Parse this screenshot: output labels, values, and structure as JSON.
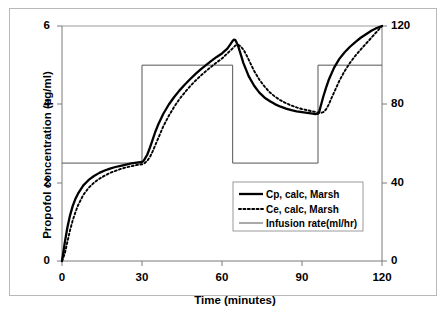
{
  "chart_data": {
    "type": "line",
    "title": "",
    "xlabel": "Time (minutes)",
    "ylabel": "Propofol concentration (µg/ml)",
    "y2label": "Infusion rate (ml/hr)",
    "xlim": [
      0,
      120
    ],
    "ylim": [
      0,
      6
    ],
    "y2lim": [
      0,
      120
    ],
    "xticks": [
      0,
      30,
      60,
      90,
      120
    ],
    "yticks": [
      0,
      2,
      4,
      6
    ],
    "y2ticks": [
      0,
      40,
      80,
      120
    ],
    "grid": false,
    "legend_position": "center-right-lower",
    "series": [
      {
        "name": "Cp, calc, Marsh",
        "style": "solid-thick",
        "axis": "left",
        "units": "µg/ml",
        "x": [
          0,
          0.5,
          1,
          2,
          3,
          4,
          5,
          6,
          8,
          10,
          12,
          14,
          16,
          18,
          20,
          22,
          24,
          26,
          28,
          30,
          30.5,
          31,
          32,
          33,
          34,
          35,
          36,
          38,
          40,
          42,
          44,
          46,
          48,
          50,
          52,
          54,
          56,
          58,
          60,
          62,
          63,
          64,
          64.5,
          65,
          66,
          67,
          68,
          70,
          72,
          74,
          76,
          78,
          80,
          82,
          84,
          86,
          88,
          90,
          92,
          94,
          95,
          96,
          96.5,
          97,
          98,
          99,
          100,
          102,
          104,
          106,
          108,
          110,
          112,
          114,
          116,
          118,
          120
        ],
        "y": [
          0,
          0.22,
          0.45,
          0.85,
          1.16,
          1.4,
          1.58,
          1.72,
          1.93,
          2.07,
          2.17,
          2.25,
          2.31,
          2.36,
          2.4,
          2.43,
          2.46,
          2.49,
          2.51,
          2.53,
          2.55,
          2.6,
          2.72,
          2.9,
          3.1,
          3.3,
          3.47,
          3.76,
          3.99,
          4.18,
          4.35,
          4.5,
          4.64,
          4.77,
          4.89,
          5.0,
          5.11,
          5.21,
          5.3,
          5.42,
          5.52,
          5.62,
          5.65,
          5.64,
          5.5,
          5.28,
          5.06,
          4.72,
          4.48,
          4.3,
          4.17,
          4.08,
          4.0,
          3.94,
          3.89,
          3.85,
          3.82,
          3.8,
          3.78,
          3.76,
          3.75,
          3.76,
          3.82,
          3.95,
          4.2,
          4.42,
          4.62,
          4.93,
          5.16,
          5.33,
          5.47,
          5.59,
          5.7,
          5.79,
          5.88,
          5.95,
          6.0
        ]
      },
      {
        "name": "Ce, calc, Marsh",
        "style": "dotted",
        "axis": "left",
        "units": "µg/ml",
        "x": [
          0,
          1,
          2,
          3,
          4,
          5,
          6,
          8,
          10,
          12,
          14,
          16,
          18,
          20,
          22,
          24,
          26,
          28,
          30,
          31,
          32,
          33,
          34,
          35,
          36,
          38,
          40,
          42,
          44,
          46,
          48,
          50,
          52,
          54,
          56,
          58,
          60,
          62,
          64,
          65,
          66,
          67,
          68,
          69,
          70,
          72,
          74,
          76,
          78,
          80,
          82,
          84,
          86,
          88,
          90,
          92,
          94,
          96,
          97,
          98,
          99,
          100,
          101,
          102,
          104,
          106,
          108,
          110,
          112,
          114,
          116,
          118,
          120
        ],
        "y": [
          0,
          0.18,
          0.48,
          0.78,
          1.03,
          1.24,
          1.42,
          1.69,
          1.87,
          2.0,
          2.1,
          2.18,
          2.25,
          2.3,
          2.35,
          2.39,
          2.42,
          2.45,
          2.47,
          2.5,
          2.56,
          2.66,
          2.8,
          2.96,
          3.12,
          3.44,
          3.7,
          3.93,
          4.13,
          4.3,
          4.46,
          4.6,
          4.73,
          4.85,
          4.96,
          5.07,
          5.17,
          5.3,
          5.43,
          5.5,
          5.52,
          5.48,
          5.4,
          5.28,
          5.14,
          4.86,
          4.63,
          4.45,
          4.3,
          4.19,
          4.1,
          4.03,
          3.97,
          3.92,
          3.88,
          3.85,
          3.82,
          3.79,
          3.78,
          3.8,
          3.87,
          3.99,
          4.15,
          4.3,
          4.6,
          4.85,
          5.06,
          5.24,
          5.4,
          5.55,
          5.7,
          5.85,
          6.0
        ]
      },
      {
        "name": "Infusion rate(ml/hr)",
        "style": "solid-thin",
        "axis": "right",
        "units": "ml/hr",
        "x": [
          0,
          30,
          30,
          64,
          64,
          96,
          96,
          120
        ],
        "y": [
          50,
          50,
          100,
          100,
          50,
          50,
          100,
          100
        ]
      }
    ]
  },
  "legend": {
    "items": [
      {
        "label": "Cp, calc, Marsh",
        "style": "solid-thick"
      },
      {
        "label": "Ce, calc, Marsh",
        "style": "dotted"
      },
      {
        "label": "Infusion rate(ml/hr)",
        "style": "solid-thin"
      }
    ]
  },
  "axes": {
    "left_title": "Propofol concentration (µg/ml)",
    "right_title": "Infusion rate (ml/hr)",
    "x_title": "Time (minutes)",
    "left_ticks": [
      "0",
      "2",
      "4",
      "6"
    ],
    "right_ticks": [
      "0",
      "40",
      "80",
      "120"
    ],
    "x_ticks": [
      "0",
      "30",
      "60",
      "90",
      "120"
    ]
  },
  "colors": {
    "series_cp": "#000000",
    "series_ce": "#000000",
    "series_infusion": "#555555",
    "axis": "#888888",
    "frame": "#b8b8b8",
    "background": "#ffffff"
  }
}
